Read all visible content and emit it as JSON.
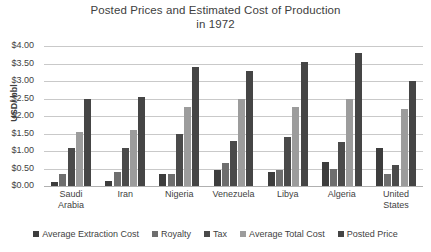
{
  "chart_data": {
    "type": "bar",
    "title": "Posted Prices and Estimated Cost of Production in 1972",
    "title_line1": "Posted Prices and Estimated Cost of Production",
    "title_line2": "in 1972",
    "xlabel": "",
    "ylabel": "USD/ bbl",
    "ylim": [
      0,
      4.0
    ],
    "ytick_step": 0.5,
    "grid": true,
    "legend_position": "bottom",
    "ytick_labels": [
      "$4.00",
      "$3.50",
      "$3.00",
      "$2.50",
      "$2.00",
      "$1.50",
      "$1.00",
      "$0.50",
      "$0.00"
    ],
    "ytick_values": [
      4.0,
      3.5,
      3.0,
      2.5,
      2.0,
      1.5,
      1.0,
      0.5,
      0.0
    ],
    "categories": [
      "Saudi Arabia",
      "Iran",
      "Nigeria",
      "Venezuela",
      "Libya",
      "Algeria",
      "United States"
    ],
    "category_lines": [
      [
        "Saudi",
        "Arabia"
      ],
      [
        "Iran",
        ""
      ],
      [
        "Nigeria",
        ""
      ],
      [
        "Venezuela",
        ""
      ],
      [
        "Libya",
        ""
      ],
      [
        "Algeria",
        ""
      ],
      [
        "United",
        "States"
      ]
    ],
    "series": [
      {
        "name": "Average Extraction Cost",
        "color": "#3d3d3d",
        "values": [
          0.12,
          0.15,
          0.35,
          0.45,
          0.4,
          0.7,
          1.1
        ]
      },
      {
        "name": "Royalty",
        "color": "#6e6e6e",
        "values": [
          0.35,
          0.4,
          0.35,
          0.65,
          0.45,
          0.5,
          0.35
        ]
      },
      {
        "name": "Tax",
        "color": "#4a4a4a",
        "values": [
          1.1,
          1.1,
          1.5,
          1.3,
          1.4,
          1.25,
          0.6
        ]
      },
      {
        "name": "Average Total Cost",
        "color": "#9c9c9c",
        "values": [
          1.55,
          1.6,
          2.25,
          2.5,
          2.25,
          2.5,
          2.2
        ]
      },
      {
        "name": "Posted Price",
        "color": "#454545",
        "values": [
          2.5,
          2.55,
          3.4,
          3.3,
          3.55,
          3.8,
          3.0
        ]
      }
    ]
  }
}
